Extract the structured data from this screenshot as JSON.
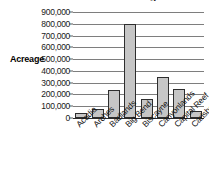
{
  "chart_data": {
    "type": "bar",
    "title": "National Park Acreage",
    "xlabel": "",
    "ylabel": "Acreage",
    "ylim": [
      0,
      900000
    ],
    "grid": true,
    "legend": "none",
    "categories": [
      "Acadia",
      "Arches",
      "Badlands",
      "Big Bend",
      "Biscayne",
      "Canyonlands",
      "Capital Reef",
      "Carlsbad Caverns"
    ],
    "values": [
      40000,
      75000,
      235000,
      800000,
      160000,
      350000,
      245000,
      60000
    ],
    "ytick_labels": [
      "900,000",
      "800,000",
      "700,000",
      "600,000",
      "500,000",
      "400,000",
      "300,000",
      "200,000",
      "100,000",
      "0"
    ],
    "ytick_values": [
      900000,
      800000,
      700000,
      600000,
      500000,
      400000,
      300000,
      200000,
      100000,
      0
    ],
    "colors": {
      "bar_fill": "#c6c6c6",
      "bar_border": "#2e2e2e",
      "gridline": "#7e7e7e",
      "axis": "#2b2b2b",
      "text": "#141414"
    }
  }
}
